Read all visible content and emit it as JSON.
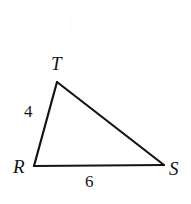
{
  "figure": {
    "kind": "triangle-diagram",
    "background_color": "#ffffff",
    "stroke_color": "#141414",
    "stroke_width": 2.2,
    "vertices": [
      {
        "id": "T",
        "label": "T",
        "x": 57,
        "y": 82
      },
      {
        "id": "R",
        "label": "R",
        "x": 34,
        "y": 166
      },
      {
        "id": "S",
        "label": "S",
        "x": 164,
        "y": 165
      }
    ],
    "vertex_labels": {
      "T": "T",
      "R": "R",
      "S": "S"
    },
    "side_labels": {
      "RT": "4",
      "RS": "6"
    },
    "polygon_points": "57,82 164,165 34,166"
  }
}
